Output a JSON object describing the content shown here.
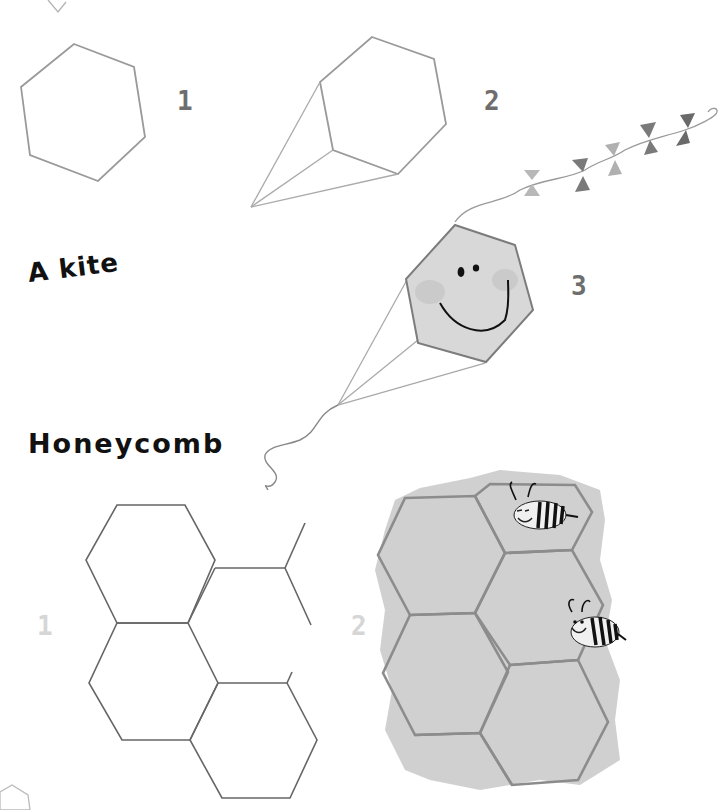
{
  "sections": {
    "kite": {
      "title": "A kite",
      "steps": [
        {
          "number": "1",
          "description": "hexagon outline"
        },
        {
          "number": "2",
          "description": "hexagon with three strings to a point"
        },
        {
          "number": "3",
          "description": "shaded smiling kite with bow tail"
        }
      ]
    },
    "honeycomb": {
      "title": "Honeycomb",
      "steps": [
        {
          "number": "1",
          "description": "hexagon grid outline"
        },
        {
          "number": "2",
          "description": "watercolor honeycomb with two bees"
        }
      ]
    }
  },
  "colors": {
    "pencil": "#9a9a9a",
    "kite_fill": "#d8d8d8",
    "comb_fill": "#c4c4c4",
    "comb_stroke": "#8c8c8c",
    "step_dark": "#6e6e6e",
    "step_light": "#d6d6d6",
    "text": "#111111"
  }
}
